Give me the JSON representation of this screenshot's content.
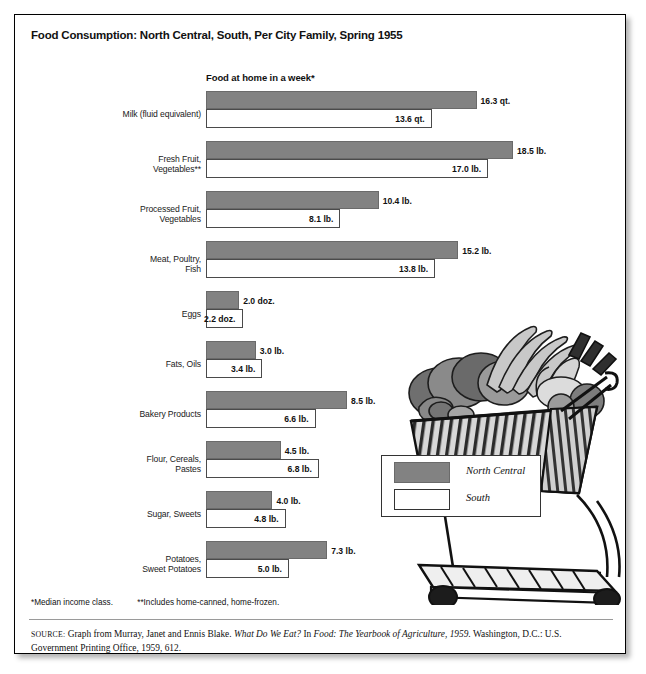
{
  "title": "Food Consumption: North Central, South, Per City Family, Spring 1955",
  "subtitle": "Food at home in a week*",
  "legend": {
    "items": [
      {
        "label": "North Central",
        "color": "#828282",
        "name": "north-central"
      },
      {
        "label": "South",
        "color": "#ffffff",
        "name": "south"
      }
    ]
  },
  "footnotes": {
    "one": "*Median income class.",
    "two": "**Includes home-canned, home-frozen."
  },
  "source": {
    "label": "SOURCE:",
    "text_before": " Graph from Murray, Janet and Ennis Blake. ",
    "italic_one": "What Do We Eat?",
    "text_mid": " In ",
    "italic_two": "Food: The Yearbook of Agriculture, 1959.",
    "text_after": " Washington, D.C.: U.S. Government Printing Office, 1959, 612."
  },
  "illustration": {
    "name": "shopping-cart-with-groceries"
  },
  "chart_data": {
    "type": "bar",
    "title": "Food Consumption: North Central, South, Per City Family, Spring 1955",
    "subtitle": "Food at home in a week*",
    "orientation": "horizontal",
    "grid": false,
    "legend_position": "inside-right",
    "xlabel": "",
    "ylabel": "",
    "xlim": [
      0,
      18.5
    ],
    "px_per_unit": 16.6,
    "categories": [
      "Milk (fluid equivalent)",
      "Fresh Fruit, Vegetables**",
      "Processed Fruit, Vegetables",
      "Meat, Poultry, Fish",
      "Eggs",
      "Fats, Oils",
      "Bakery Products",
      "Flour, Cereals, Pastes",
      "Sugar, Sweets",
      "Potatoes, Sweet Potatoes"
    ],
    "category_lines": [
      [
        "Milk (fluid equivalent)"
      ],
      [
        "Fresh Fruit,",
        "Vegetables**"
      ],
      [
        "Processed Fruit,",
        "Vegetables"
      ],
      [
        "Meat, Poultry,",
        "Fish"
      ],
      [
        "Eggs"
      ],
      [
        "Fats, Oils"
      ],
      [
        "Bakery Products"
      ],
      [
        "Flour, Cereals,",
        "Pastes"
      ],
      [
        "Sugar, Sweets"
      ],
      [
        "Potatoes,",
        "Sweet Potatoes"
      ]
    ],
    "series": [
      {
        "name": "North Central",
        "color": "#828282",
        "values": [
          16.3,
          18.5,
          10.4,
          15.2,
          2.0,
          3.0,
          8.5,
          4.5,
          4.0,
          7.3
        ],
        "labels": [
          "16.3 qt.",
          "18.5 lb.",
          "10.4 lb.",
          "15.2 lb.",
          "2.0 doz.",
          "3.0 lb.",
          "8.5 lb.",
          "4.5 lb.",
          "4.0 lb.",
          "7.3 lb."
        ]
      },
      {
        "name": "South",
        "color": "#ffffff",
        "values": [
          13.6,
          17.0,
          8.1,
          13.8,
          2.2,
          3.4,
          6.6,
          6.8,
          4.8,
          5.0
        ],
        "labels": [
          "13.6 qt.",
          "17.0 lb.",
          "8.1 lb.",
          "13.8 lb.",
          "2.2 doz.",
          "3.4 lb.",
          "6.6 lb.",
          "6.8 lb.",
          "4.8 lb.",
          "5.0 lb."
        ]
      }
    ]
  }
}
